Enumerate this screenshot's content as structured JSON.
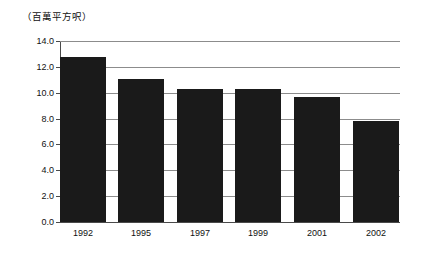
{
  "chart_data": {
    "type": "bar",
    "title": "",
    "subtitle": "",
    "unit_caption": "（百萬平方呎）",
    "xlabel": "",
    "ylabel": "",
    "categories": [
      "1992",
      "1995",
      "1997",
      "1999",
      "2001",
      "2002"
    ],
    "values": [
      12.8,
      11.1,
      10.3,
      10.25,
      9.7,
      7.85
    ],
    "series": [
      {
        "name": "",
        "values": [
          12.8,
          11.1,
          10.3,
          10.25,
          9.7,
          7.85
        ]
      }
    ],
    "ylim": [
      0.0,
      14.0
    ],
    "ytick_labels": [
      "14.0",
      "12.0",
      "10.0",
      "8.0",
      "6.0",
      "4.0",
      "2.0",
      "0.0"
    ],
    "ytick_values": [
      14.0,
      12.0,
      10.0,
      8.0,
      6.0,
      4.0,
      2.0,
      0.0
    ],
    "grid": true,
    "grid_axis": "y",
    "legend": false,
    "legend_position": "none",
    "bar_color": "#1a1a1a",
    "grid_color": "#8c8c8c",
    "axis_color": "#4a4a4a",
    "background_color": "#ffffff"
  }
}
